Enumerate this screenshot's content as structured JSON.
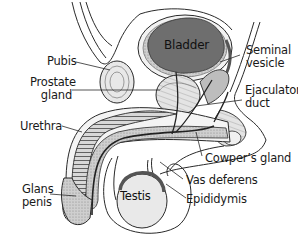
{
  "figure": {
    "colors": {
      "outline": "#2a2a2a",
      "bladder_fill": "#6e6e6e",
      "tissue_light": "#e6e6e6",
      "tissue_mid": "#bdbdbd",
      "tissue_dark": "#8a8a8a",
      "testis_fill": "#e9e9e9",
      "background": "#ffffff"
    }
  },
  "labels": {
    "bladder": "Bladder",
    "seminal_vesicle_line1": "Seminal",
    "seminal_vesicle_line2": "vesicle",
    "pubis": "Pubis",
    "prostate_line1": "Prostate",
    "prostate_line2": "gland",
    "ejaculatory_line1": "Ejaculatory",
    "ejaculatory_line2": "duct",
    "urethra": "Urethra",
    "cowpers_gland": "Cowper’s gland",
    "glans_line1": "Glans",
    "glans_line2": "penis",
    "testis": "Testis",
    "vas_deferens": "Vas deferens",
    "epididymis": "Epididymis"
  }
}
